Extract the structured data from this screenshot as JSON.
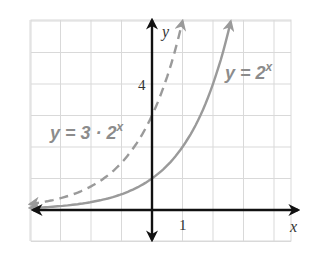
{
  "chart_data": {
    "type": "line",
    "title": "",
    "xlabel": "x",
    "ylabel": "y",
    "xlim": [
      -4,
      4.5
    ],
    "ylim": [
      -1,
      6
    ],
    "grid": true,
    "tick_labels": {
      "x": [
        "1"
      ],
      "y": [
        "4"
      ]
    },
    "series": [
      {
        "name": "y = 2^x",
        "label_text": "y = 2",
        "label_sup": "x",
        "style": "solid",
        "color": "#9a9a9a",
        "formula": "2^x",
        "a": 1,
        "x_range": [
          -4,
          2.58
        ],
        "points": [
          [
            -4,
            0.06
          ],
          [
            -3,
            0.13
          ],
          [
            -2,
            0.25
          ],
          [
            -1,
            0.5
          ],
          [
            0,
            1
          ],
          [
            1,
            2
          ],
          [
            2,
            4
          ],
          [
            2.58,
            6
          ]
        ]
      },
      {
        "name": "y = 3 · 2^x",
        "label_text": "y = 3 · 2",
        "label_sup": "x",
        "style": "dashed",
        "color": "#9a9a9a",
        "formula": "3*2^x",
        "a": 3,
        "x_range": [
          -4,
          1.0
        ],
        "points": [
          [
            -4,
            0.19
          ],
          [
            -3,
            0.38
          ],
          [
            -2,
            0.75
          ],
          [
            -1,
            1.5
          ],
          [
            0,
            3
          ],
          [
            1,
            6
          ]
        ]
      }
    ]
  },
  "colors": {
    "grid": "#d9d9d9",
    "axis": "#111111",
    "curve": "#9a9a9a",
    "equation_label": "#8c8c8c"
  }
}
